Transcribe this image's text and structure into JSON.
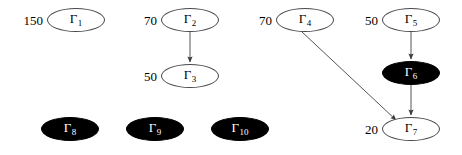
{
  "figure": {
    "type": "node-link-diagram",
    "background_color": "#ffffff",
    "width": 462,
    "height": 155,
    "node_fill_open": "#ffffff",
    "node_fill_closed": "#000000",
    "node_stroke": "#4a4a4a",
    "edge_color": "#555555"
  },
  "nodes": [
    {
      "id": "gamma-1",
      "symbol": "Γ",
      "index": "1",
      "weight": "150",
      "filled": false,
      "cx": 76,
      "cy": 20,
      "rx": 29,
      "ry": 12
    },
    {
      "id": "gamma-2",
      "symbol": "Γ",
      "index": "2",
      "weight": "70",
      "filled": false,
      "cx": 190,
      "cy": 20,
      "rx": 29,
      "ry": 12
    },
    {
      "id": "gamma-3",
      "symbol": "Γ",
      "index": "3",
      "weight": "50",
      "filled": false,
      "cx": 190,
      "cy": 76,
      "rx": 29,
      "ry": 12
    },
    {
      "id": "gamma-4",
      "symbol": "Γ",
      "index": "4",
      "weight": "70",
      "filled": false,
      "cx": 305,
      "cy": 20,
      "rx": 29,
      "ry": 12
    },
    {
      "id": "gamma-5",
      "symbol": "Γ",
      "index": "5",
      "weight": "50",
      "filled": false,
      "cx": 411,
      "cy": 20,
      "rx": 29,
      "ry": 12
    },
    {
      "id": "gamma-6",
      "symbol": "Γ",
      "index": "6",
      "weight": "",
      "filled": true,
      "cx": 411,
      "cy": 73,
      "rx": 29,
      "ry": 12
    },
    {
      "id": "gamma-7",
      "symbol": "Γ",
      "index": "7",
      "weight": "20",
      "filled": false,
      "cx": 411,
      "cy": 129,
      "rx": 29,
      "ry": 12
    },
    {
      "id": "gamma-8",
      "symbol": "Γ",
      "index": "8",
      "weight": "",
      "filled": true,
      "cx": 70,
      "cy": 129,
      "rx": 29,
      "ry": 12
    },
    {
      "id": "gamma-9",
      "symbol": "Γ",
      "index": "9",
      "weight": "",
      "filled": true,
      "cx": 155,
      "cy": 129,
      "rx": 29,
      "ry": 12
    },
    {
      "id": "gamma-10",
      "symbol": "Γ",
      "index": "10",
      "weight": "",
      "filled": true,
      "cx": 240,
      "cy": 129,
      "rx": 29,
      "ry": 12
    }
  ],
  "edges": [
    {
      "id": "edge-2-3",
      "from": "gamma-2",
      "to": "gamma-3",
      "x1": 190,
      "y1": 32,
      "x2": 190,
      "y2": 62
    },
    {
      "id": "edge-5-6",
      "from": "gamma-5",
      "to": "gamma-6",
      "x1": 411,
      "y1": 32,
      "x2": 411,
      "y2": 59
    },
    {
      "id": "edge-6-7",
      "from": "gamma-6",
      "to": "gamma-7",
      "x1": 411,
      "y1": 85,
      "x2": 411,
      "y2": 115
    },
    {
      "id": "edge-4-7",
      "from": "gamma-4",
      "to": "gamma-7",
      "x1": 301,
      "y1": 31,
      "x2": 396,
      "y2": 120
    }
  ]
}
